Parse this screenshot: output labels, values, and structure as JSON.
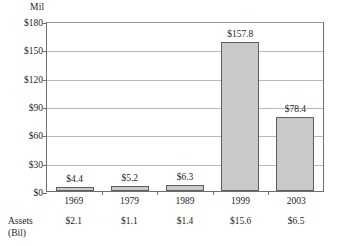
{
  "chart_data": {
    "type": "bar",
    "title": "",
    "subtitle": "",
    "unit_label": "Mil",
    "xlabel": "",
    "ylabel": "",
    "ylim": [
      0,
      180
    ],
    "ytick_step": 30,
    "grid": true,
    "legend": null,
    "categories": [
      "1969",
      "1979",
      "1989",
      "1999",
      "2003"
    ],
    "values": [
      4.4,
      5.2,
      6.3,
      157.8,
      78.4
    ],
    "value_labels": [
      "$4.4",
      "$5.2",
      "$6.3",
      "$157.8",
      "$78.4"
    ],
    "ytick_labels": [
      "$180",
      "$150",
      "$120",
      "$90",
      "$60",
      "$30",
      "$0"
    ],
    "ytick_values": [
      180,
      150,
      120,
      90,
      60,
      30,
      0
    ],
    "secondary_row": {
      "caption_line1": "Assets",
      "caption_line2": "(Bil)",
      "values": [
        2.1,
        1.1,
        1.4,
        15.6,
        6.5
      ],
      "value_labels": [
        "$2.1",
        "$1.1",
        "$1.4",
        "$15.6",
        "$6.5"
      ]
    },
    "colors": {
      "bar_fill": "#c9c9c9",
      "bar_border": "#5e5e5e",
      "gridline": "#b9b9b9",
      "axis": "#6f6f6f",
      "text": "#231f20",
      "background": "#ffffff"
    }
  }
}
